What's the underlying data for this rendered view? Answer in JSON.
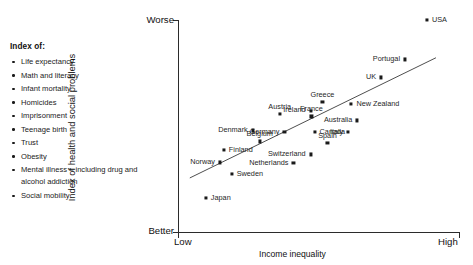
{
  "legend": {
    "title": "Index of:",
    "items": [
      "Life expectancy",
      "Math and literacy",
      "Infant mortality",
      "Homicides",
      "Imprisonment",
      "Teenage birth",
      "Trust",
      "Obesity",
      "Mental illness – including drug and alcohol addiction",
      "Social mobility"
    ]
  },
  "axes": {
    "y_label": "Index of health and social problems",
    "y_top": "Worse",
    "y_bottom": "Better",
    "x_label": "Income inequality",
    "x_left": "Low",
    "x_right": "High"
  },
  "chart_data": {
    "type": "scatter",
    "title": "",
    "xlabel": "Income inequality",
    "ylabel": "Index of health and social problems",
    "xlim": [
      0,
      1
    ],
    "ylim": [
      0,
      1
    ],
    "xtick_labels": [
      "Low",
      "High"
    ],
    "ytick_labels": [
      "Better",
      "Worse"
    ],
    "grid": false,
    "legend_position": "none",
    "trend_line": {
      "present": true,
      "x0": 0.042,
      "y0": 0.255,
      "x1": 0.918,
      "y1": 0.822
    },
    "points": [
      {
        "name": "USA",
        "x": 0.886,
        "y": 1.0,
        "lx": 5,
        "ly": 0,
        "align": "lr"
      },
      {
        "name": "Portugal",
        "x": 0.808,
        "y": 0.814,
        "lx": -5,
        "ly": 0,
        "align": "rl"
      },
      {
        "name": "UK",
        "x": 0.723,
        "y": 0.729,
        "lx": -5,
        "ly": 0,
        "align": "rl"
      },
      {
        "name": "New Zealand",
        "x": 0.617,
        "y": 0.606,
        "lx": 5,
        "ly": 0,
        "align": "lr"
      },
      {
        "name": "Greece",
        "x": 0.514,
        "y": 0.612,
        "lx": 0,
        "ly": -11,
        "align": "cb"
      },
      {
        "name": "Ireland",
        "x": 0.472,
        "y": 0.573,
        "lx": -5,
        "ly": -1,
        "align": "rl"
      },
      {
        "name": "Australia",
        "x": 0.638,
        "y": 0.526,
        "lx": -5,
        "ly": 0,
        "align": "rl"
      },
      {
        "name": "Italy",
        "x": 0.606,
        "y": 0.474,
        "lx": -5,
        "ly": 0,
        "align": "rl"
      },
      {
        "name": "France",
        "x": 0.475,
        "y": 0.545,
        "lx": 0,
        "ly": -11,
        "align": "cb"
      },
      {
        "name": "Canada",
        "x": 0.486,
        "y": 0.474,
        "lx": 5,
        "ly": 0,
        "align": "lr"
      },
      {
        "name": "Spain",
        "x": 0.532,
        "y": 0.418,
        "lx": 0,
        "ly": -11,
        "align": "cb"
      },
      {
        "name": "Austria",
        "x": 0.362,
        "y": 0.555,
        "lx": 0,
        "ly": -11,
        "align": "cb"
      },
      {
        "name": "Germany",
        "x": 0.379,
        "y": 0.474,
        "lx": -5,
        "ly": 0,
        "align": "rl"
      },
      {
        "name": "Denmark",
        "x": 0.266,
        "y": 0.479,
        "lx": -5,
        "ly": 0,
        "align": "rl"
      },
      {
        "name": "Switzerland",
        "x": 0.472,
        "y": 0.366,
        "lx": -5,
        "ly": 0,
        "align": "rl"
      },
      {
        "name": "Belgium",
        "x": 0.291,
        "y": 0.427,
        "lx": 0,
        "ly": -11,
        "align": "cb"
      },
      {
        "name": "Netherlands",
        "x": 0.411,
        "y": 0.324,
        "lx": -5,
        "ly": 0,
        "align": "rl"
      },
      {
        "name": "Finland",
        "x": 0.163,
        "y": 0.385,
        "lx": 5,
        "ly": 0,
        "align": "lr"
      },
      {
        "name": "Norway",
        "x": 0.149,
        "y": 0.328,
        "lx": -5,
        "ly": 0,
        "align": "rl"
      },
      {
        "name": "Sweden",
        "x": 0.191,
        "y": 0.272,
        "lx": 5,
        "ly": 0,
        "align": "lr"
      },
      {
        "name": "Japan",
        "x": 0.099,
        "y": 0.159,
        "lx": 5,
        "ly": 0,
        "align": "lr"
      }
    ]
  }
}
